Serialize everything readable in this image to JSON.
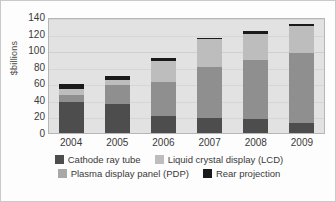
{
  "chart_data": {
    "type": "bar",
    "stacked": true,
    "title": "",
    "xlabel": "",
    "ylabel": "$billions",
    "ylim": [
      0,
      140
    ],
    "ytick_step": 20,
    "yticks": [
      140,
      120,
      100,
      80,
      60,
      40,
      20,
      0
    ],
    "grid": true,
    "legend_position": "bottom",
    "categories": [
      "2004",
      "2005",
      "2006",
      "2007",
      "2008",
      "2009"
    ],
    "stack_order_bottom_to_top": [
      "Cathode ray tube",
      "Plasma display panel (PDP)",
      "Liquid crystal display (LCD)",
      "Rear projection"
    ],
    "series": [
      {
        "name": "Cathode ray tube",
        "color": "#4d4d4d",
        "values": [
          38,
          35,
          20,
          18,
          17,
          12
        ]
      },
      {
        "name": "Plasma display panel (PDP)",
        "color": "#8f8f8f",
        "values": [
          8,
          23,
          42,
          62,
          71,
          85
        ]
      },
      {
        "name": "Liquid crystal display (LCD)",
        "color": "#bdbdbd",
        "values": [
          7,
          6,
          25,
          33,
          32,
          32
        ]
      },
      {
        "name": "Rear projection",
        "color": "#1a1a1a",
        "values": [
          6,
          5,
          4,
          2,
          3,
          3
        ]
      }
    ],
    "totals": [
      59,
      69,
      91,
      115,
      123,
      132
    ]
  },
  "legend": {
    "rows": [
      [
        {
          "label": "Cathode ray tube",
          "color": "#4d4d4d"
        },
        {
          "label": "Liquid crystal display (LCD)",
          "color": "#bdbdbd"
        }
      ],
      [
        {
          "label": "Plasma display panel (PDP)",
          "color": "#a8a8a8"
        },
        {
          "label": "Rear projection",
          "color": "#1a1a1a"
        }
      ]
    ]
  },
  "style": {
    "plot_background": "#e2e2e2",
    "page_background": "#fdfdfd",
    "axis_text_color": "#3a3a3a"
  }
}
